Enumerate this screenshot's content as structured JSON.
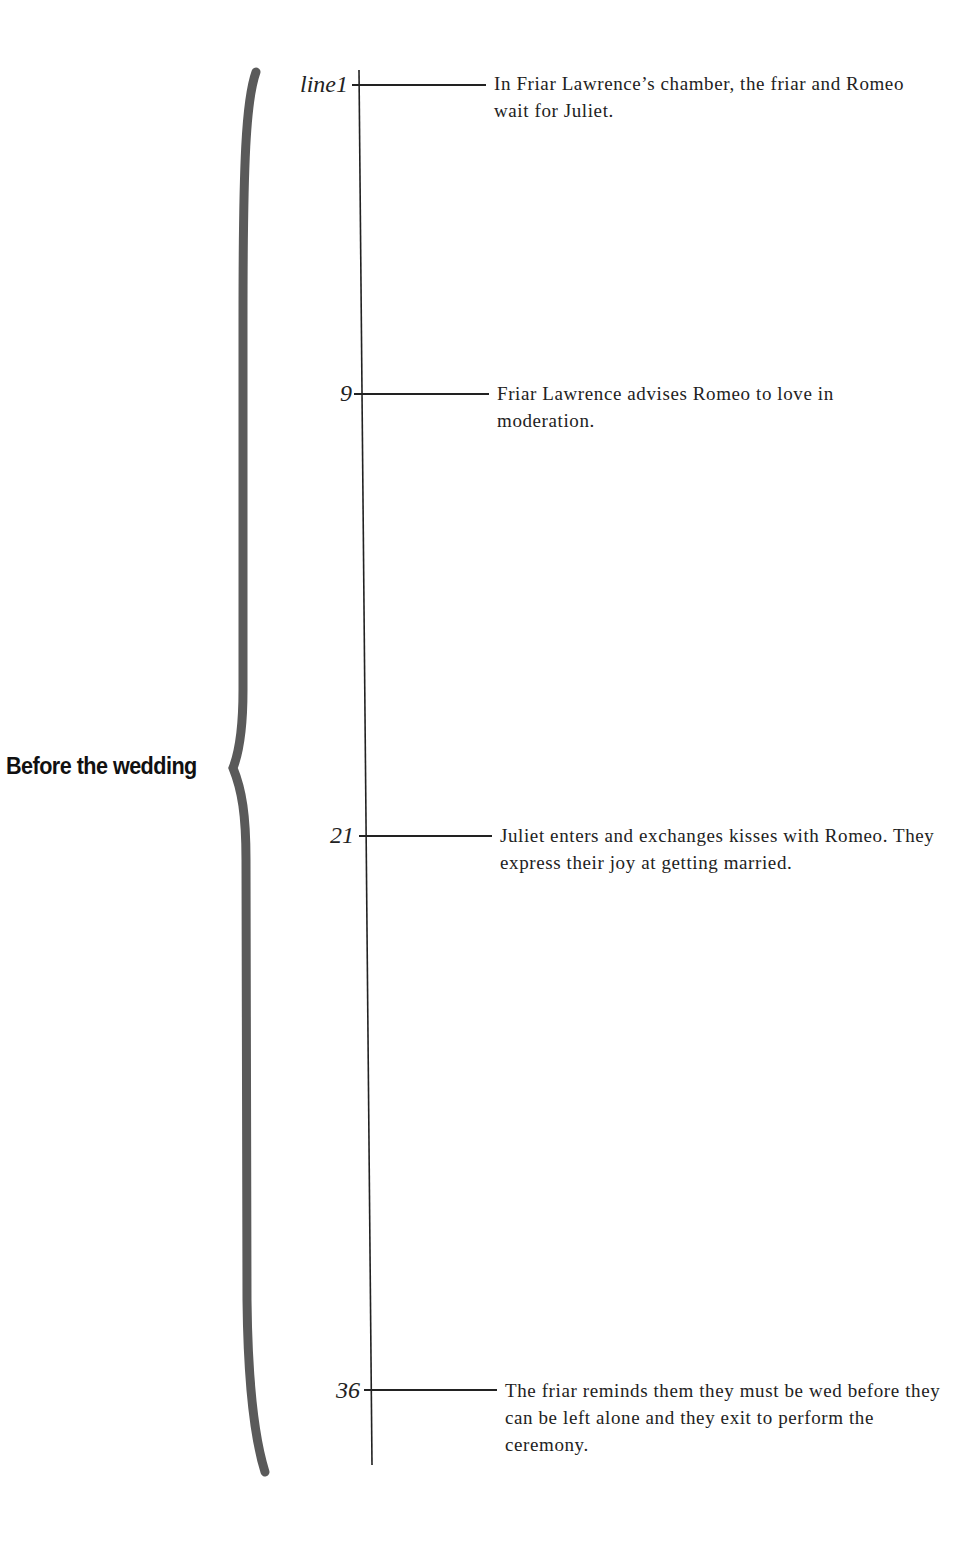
{
  "diagram": {
    "group": {
      "label": "Before the wedding"
    },
    "colors": {
      "brace": "#5a5a5a",
      "line": "#222222",
      "text": "#222222"
    },
    "events": [
      {
        "line": "line1",
        "text": "In Friar Lawrence’s chamber, the friar and Romeo wait for Juliet."
      },
      {
        "line": "9",
        "text": "Friar Lawrence advises Romeo to love in moderation."
      },
      {
        "line": "21",
        "text": "Juliet enters and exchanges kisses with Romeo. They express their joy at getting married."
      },
      {
        "line": "36",
        "text": "The friar reminds them they must be wed before they can be left alone and they exit to perform the ceremony."
      }
    ]
  }
}
